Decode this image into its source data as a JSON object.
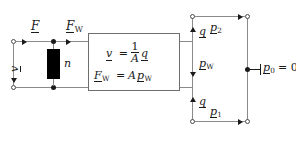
{
  "diagram": {
    "colors": {
      "wire": "#8a8a8a",
      "node_stroke": "#4a4a4a",
      "filled": "#1a1a1a",
      "text": "#1b1b1b",
      "box_border": "#6e6e6e",
      "background": "#ffffff"
    },
    "left_network": {
      "voltage_label": "v",
      "force_label": "F",
      "force_w_label": "F",
      "force_w_sub": "W",
      "transformer_ratio_label": "n"
    },
    "equation_box": {
      "equation_1": {
        "lhs": "v",
        "equals": "=",
        "fraction_numerator": "1",
        "fraction_denominator": "A",
        "rhs": "q"
      },
      "equation_2": {
        "lhs": "F",
        "lhs_sub": "W",
        "equals": "=",
        "coefficient": "A",
        "rhs": "p",
        "rhs_sub": "W"
      }
    },
    "right_network": {
      "flow_top_label": "q",
      "flow_bottom_label": "q",
      "pressure_2_label": "p",
      "pressure_2_sub": "2",
      "pressure_w_label": "p",
      "pressure_w_sub": "W",
      "pressure_1_label": "p",
      "pressure_1_sub": "1",
      "reference_label": "p",
      "reference_sub": "0",
      "reference_equals": "= 0"
    }
  }
}
